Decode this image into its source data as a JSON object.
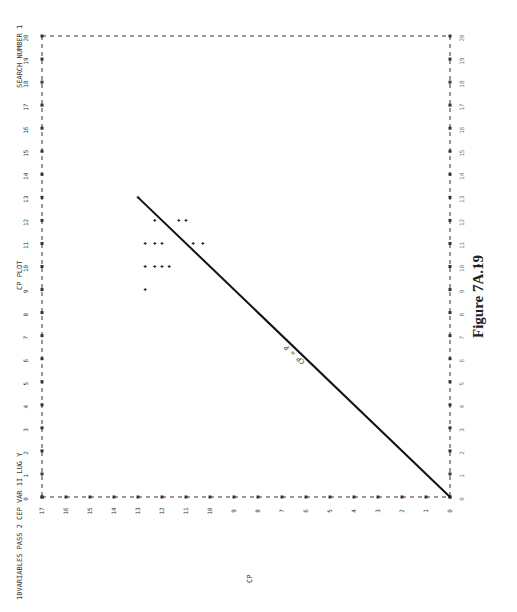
{
  "header": {
    "left_label": "10VARIABLES PASS 2  CEP VAR 1I LUG Y",
    "center_label": "CP PLOT",
    "right_label": "SEARCH NUMBER 1"
  },
  "figure_caption": "Figure 7A.19",
  "line_label": "CP = P",
  "chart_data": {
    "type": "scatter",
    "title": "CP PLOT",
    "orientation": "rotated 90deg counter-clockwise on page",
    "xlabel": "P",
    "ylabel": "CP",
    "xlim": [
      0,
      20
    ],
    "ylim": [
      0,
      17
    ],
    "x_ticks": [
      0,
      1,
      2,
      3,
      4,
      5,
      6,
      7,
      8,
      9,
      10,
      11,
      12,
      13,
      14,
      15,
      16,
      17,
      18,
      19,
      20
    ],
    "y_ticks": [
      0,
      1,
      2,
      3,
      4,
      5,
      6,
      7,
      8,
      9,
      10,
      11,
      12,
      13,
      14,
      15,
      16,
      17
    ],
    "grid": false,
    "reference_line": {
      "label": "CP = P",
      "from": [
        0,
        0
      ],
      "to": [
        13,
        13
      ]
    },
    "series": [
      {
        "name": "subsets",
        "points": [
          {
            "p": 9,
            "cp": 12.7
          },
          {
            "p": 10,
            "cp": 12.7
          },
          {
            "p": 10,
            "cp": 12.3
          },
          {
            "p": 10,
            "cp": 12.0
          },
          {
            "p": 10,
            "cp": 11.7
          },
          {
            "p": 11,
            "cp": 12.7
          },
          {
            "p": 11,
            "cp": 12.3
          },
          {
            "p": 11,
            "cp": 12.0
          },
          {
            "p": 11,
            "cp": 10.7
          },
          {
            "p": 11,
            "cp": 10.3
          },
          {
            "p": 12,
            "cp": 12.3
          },
          {
            "p": 12,
            "cp": 11.3
          },
          {
            "p": 12,
            "cp": 11.0
          },
          {
            "p": 13,
            "cp": 13.0
          }
        ]
      }
    ]
  },
  "colors": {
    "ink": "#222222",
    "axis": "#333333",
    "background": "#ffffff"
  }
}
